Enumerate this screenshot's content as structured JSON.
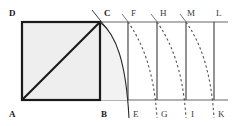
{
  "figure": {
    "canvas": {
      "width": 232,
      "height": 126
    },
    "colors": {
      "background": "#ffffff",
      "square_fill": "#eeeeee",
      "heavy_stroke": "#1a1a1a",
      "baseline_stroke": "#9a9a9a",
      "thin_stroke": "#4a4a4a",
      "dashed_stroke": "#5a5a5a",
      "label_color": "#1a1a1a"
    },
    "labels": [
      {
        "id": "label-D",
        "text": "D",
        "x": 9,
        "y": 9,
        "weight": "bold"
      },
      {
        "id": "label-C",
        "text": "C",
        "x": 104,
        "y": 9,
        "weight": "bold"
      },
      {
        "id": "label-F",
        "text": "F",
        "x": 131,
        "y": 9,
        "weight": "light"
      },
      {
        "id": "label-H",
        "text": "H",
        "x": 160,
        "y": 9,
        "weight": "light"
      },
      {
        "id": "label-M",
        "text": "M",
        "x": 187,
        "y": 9,
        "weight": "light"
      },
      {
        "id": "label-L",
        "text": "L",
        "x": 216,
        "y": 9,
        "weight": "light"
      },
      {
        "id": "label-A",
        "text": "A",
        "x": 9,
        "y": 110,
        "weight": "bold"
      },
      {
        "id": "label-B",
        "text": "B",
        "x": 101,
        "y": 110,
        "weight": "bold"
      },
      {
        "id": "label-E",
        "text": "E",
        "x": 133,
        "y": 110,
        "weight": "light"
      },
      {
        "id": "label-G",
        "text": "G",
        "x": 161,
        "y": 110,
        "weight": "light"
      },
      {
        "id": "label-I",
        "text": "I",
        "x": 191,
        "y": 110,
        "weight": "light"
      },
      {
        "id": "label-K",
        "text": "K",
        "x": 218,
        "y": 110,
        "weight": "light"
      }
    ],
    "points": {
      "A": {
        "x": 22,
        "y": 100
      },
      "B": {
        "x": 100,
        "y": 100
      },
      "C": {
        "x": 100,
        "y": 22
      },
      "D": {
        "x": 22,
        "y": 22
      },
      "E": {
        "x": 128,
        "y": 100
      },
      "F": {
        "x": 128,
        "y": 22
      },
      "G": {
        "x": 157,
        "y": 100
      },
      "H": {
        "x": 157,
        "y": 22
      },
      "I": {
        "x": 186,
        "y": 100
      },
      "M": {
        "x": 186,
        "y": 22
      },
      "K": {
        "x": 214,
        "y": 100
      },
      "L": {
        "x": 214,
        "y": 22
      }
    },
    "elements": {
      "square_label": "square-ABCD",
      "diagonal_label": "diagonal-AC",
      "arc_label": "arc-C-to-E",
      "top_baseline_label": "top-baseline-DL",
      "bottom_baseline_label": "bottom-baseline-AK",
      "vertical_lines": [
        "line-FE",
        "line-HG",
        "line-MI",
        "line-LK"
      ],
      "dashed_curves": [
        "curve-F-to-G",
        "curve-H-to-I",
        "curve-M-to-K"
      ]
    }
  }
}
